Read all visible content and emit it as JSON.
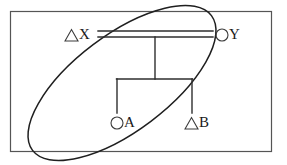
{
  "figure": {
    "type": "pedigree-kinship-diagram",
    "width": 287,
    "height": 165,
    "background_color": "#ffffff",
    "frame": {
      "name": "outer-border",
      "stroke_color": "#555555",
      "x": 10,
      "y": 11,
      "width": 262,
      "height": 141
    }
  },
  "grouping": {
    "shape": "ellipse",
    "label": "",
    "stroke_color": "#1f1f1f",
    "center_x": 122,
    "center_y": 83,
    "radius_x": 112,
    "radius_y": 48,
    "rotation_deg": -37,
    "encloses": [
      "X",
      "A",
      "B"
    ],
    "excludes": [
      "Y"
    ]
  },
  "nodes": [
    {
      "id": "X",
      "label": "X",
      "symbol": "triangle",
      "symbol_glyph": "△",
      "generation": 1,
      "x": 72,
      "y": 35,
      "inside_grouping": true
    },
    {
      "id": "Y",
      "label": "Y",
      "symbol": "circle",
      "symbol_glyph": "○",
      "generation": 1,
      "x": 226,
      "y": 35,
      "inside_grouping": false
    },
    {
      "id": "A",
      "label": "A",
      "symbol": "circle",
      "symbol_glyph": "○",
      "generation": 2,
      "x": 121,
      "y": 123,
      "inside_grouping": true
    },
    {
      "id": "B",
      "label": "B",
      "symbol": "triangle",
      "symbol_glyph": "△",
      "generation": 2,
      "x": 191,
      "y": 123,
      "inside_grouping": true
    }
  ],
  "links": [
    {
      "name": "marriage-line",
      "type": "double-horizontal",
      "from": "X",
      "to": "Y",
      "x1": 98,
      "x2": 213,
      "y_upper": 31,
      "y_lower": 37
    },
    {
      "name": "descent-line",
      "type": "vertical",
      "x": 155,
      "y1": 37,
      "y2": 79
    },
    {
      "name": "sibship-bar",
      "type": "horizontal",
      "x1": 117,
      "x2": 192,
      "y": 79
    },
    {
      "name": "child-drop-a",
      "type": "vertical",
      "to": "A",
      "x": 117,
      "y1": 79,
      "y2": 113
    },
    {
      "name": "child-drop-b",
      "type": "vertical",
      "to": "B",
      "x": 192,
      "y1": 79,
      "y2": 113
    }
  ]
}
